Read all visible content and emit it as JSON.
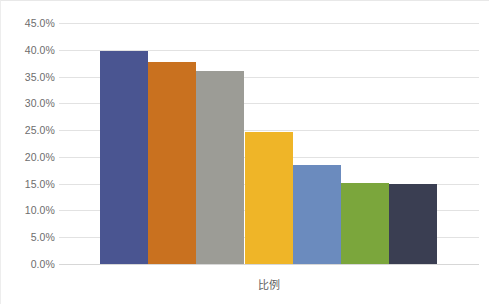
{
  "chart_data": {
    "type": "bar",
    "title": "",
    "subtitle": "",
    "xlabel": "比例",
    "ylabel": "",
    "ylim": [
      0,
      45
    ],
    "grid": true,
    "legend": "none",
    "orientation": "vertical",
    "value_suffix": "%",
    "categories": [
      "1",
      "2",
      "3",
      "4",
      "5",
      "6",
      "7"
    ],
    "values": [
      39.8,
      37.7,
      36.0,
      24.7,
      18.5,
      15.2,
      15.0
    ],
    "colors": [
      "#4a5591",
      "#c9711f",
      "#9c9c96",
      "#efb528",
      "#6b8bbe",
      "#7ba63c",
      "#3a3e52"
    ],
    "yticks": [
      {
        "value": 45,
        "label": "45.0%"
      },
      {
        "value": 40,
        "label": "40.0%"
      },
      {
        "value": 35,
        "label": "35.0%"
      },
      {
        "value": 30,
        "label": "30.0%"
      },
      {
        "value": 25,
        "label": "25.0%"
      },
      {
        "value": 20,
        "label": "20.0%"
      },
      {
        "value": 15,
        "label": "15.0%"
      },
      {
        "value": 10,
        "label": "10.0%"
      },
      {
        "value": 5,
        "label": "5.0%"
      },
      {
        "value": 0,
        "label": "0.0%"
      }
    ]
  }
}
